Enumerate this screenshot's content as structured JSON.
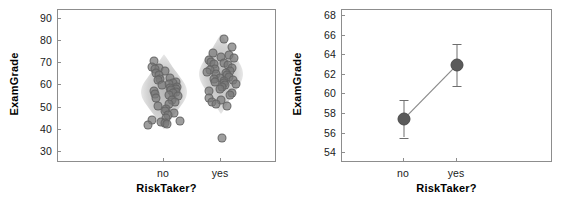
{
  "figure": {
    "width": 570,
    "height": 201,
    "background": "#ffffff",
    "panel_count": 2
  },
  "chart_data": [
    {
      "panel": "left",
      "type": "scatter",
      "subtype": "violin-swarm",
      "title": "",
      "xlabel": "RiskTaker?",
      "ylabel": "ExamGrade",
      "categories": [
        "no",
        "yes"
      ],
      "ylim": [
        25,
        94
      ],
      "yticks": [
        30,
        40,
        50,
        60,
        70,
        80,
        90
      ],
      "ytick_labels": [
        "30",
        "40",
        "50",
        "60",
        "70",
        "80",
        "90"
      ],
      "grid": false,
      "legend": "none",
      "marker_color": "#787878",
      "violin_color": "#8a8a8a",
      "series": [
        {
          "name": "no",
          "values": [
            71.0,
            68.5,
            68.0,
            67.5,
            66.5,
            65.5,
            64.5,
            63.5,
            63.0,
            62.5,
            61.5,
            61.0,
            60.5,
            60.0,
            59.5,
            59.0,
            58.5,
            58.0,
            57.5,
            57.0,
            56.5,
            56.0,
            55.5,
            55.0,
            54.5,
            53.5,
            52.5,
            51.5,
            50.5,
            49.5,
            48.5,
            47.5,
            46.5,
            45.5,
            44.5,
            44.0,
            43.5,
            43.0,
            42.5,
            42.0
          ],
          "mean": 57.5
        },
        {
          "name": "yes",
          "values": [
            81.0,
            77.5,
            74.5,
            73.5,
            73.0,
            72.5,
            71.5,
            70.5,
            70.0,
            69.5,
            69.0,
            68.0,
            67.5,
            67.0,
            66.5,
            66.0,
            65.5,
            65.0,
            64.5,
            64.0,
            63.5,
            63.0,
            62.5,
            62.0,
            61.5,
            61.0,
            60.5,
            60.0,
            59.5,
            58.5,
            57.5,
            56.5,
            55.5,
            54.5,
            53.5,
            52.5,
            51.5,
            50.5,
            36.5
          ],
          "mean": 63.0
        }
      ]
    },
    {
      "panel": "right",
      "type": "line",
      "subtype": "mean-with-error-bars",
      "title": "",
      "xlabel": "RiskTaker?",
      "ylabel": "ExamGrade",
      "categories": [
        "no",
        "yes"
      ],
      "x": [
        "no",
        "yes"
      ],
      "ylim": [
        53.0,
        68.6
      ],
      "yticks": [
        54,
        56,
        58,
        60,
        62,
        64,
        66,
        68
      ],
      "ytick_labels": [
        "54",
        "56",
        "58",
        "60",
        "62",
        "64",
        "66",
        "68"
      ],
      "grid": false,
      "legend": "none",
      "marker_color": "#5a5a5a",
      "line_color": "#8a8a8a",
      "series": [
        {
          "name": "mean ExamGrade",
          "values": [
            57.5,
            63.0
          ],
          "error_low": [
            55.6,
            60.9
          ],
          "error_high": [
            59.4,
            65.1
          ]
        }
      ]
    }
  ],
  "panels": {
    "left": {
      "name": "violin-swarm-panel",
      "ylabel": "ExamGrade",
      "xlabel": "RiskTaker?",
      "ytick_labels": [
        "90",
        "80",
        "70",
        "60",
        "50",
        "40",
        "30"
      ],
      "xtick_labels": [
        "no",
        "yes"
      ]
    },
    "right": {
      "name": "mean-errorbar-panel",
      "ylabel": "ExamGrade",
      "xlabel": "RiskTaker?",
      "ytick_labels": [
        "68",
        "66",
        "64",
        "62",
        "60",
        "58",
        "56",
        "54"
      ],
      "xtick_labels": [
        "no",
        "yes"
      ]
    }
  }
}
